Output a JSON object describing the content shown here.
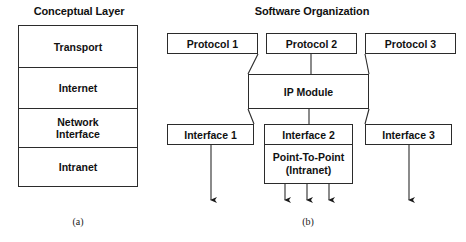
{
  "figure": {
    "panel_a": {
      "title": "Conceptual Layer",
      "caption": "(a)",
      "layers": [
        {
          "label": "Transport"
        },
        {
          "label": "Internet"
        },
        {
          "label_line1": "Network",
          "label_line2": "Interface"
        },
        {
          "label": "Intranet"
        }
      ]
    },
    "panel_b": {
      "title": "Software Organization",
      "caption": "(b)",
      "protocols": [
        {
          "label": "Protocol 1"
        },
        {
          "label": "Protocol 2"
        },
        {
          "label": "Protocol 3"
        }
      ],
      "ip_module": {
        "label": "IP Module"
      },
      "interfaces": [
        {
          "label": "Interface 1"
        },
        {
          "label": "Interface 2",
          "sub_line1": "Point-To-Point",
          "sub_line2": "(Intranet)"
        },
        {
          "label": "Interface 3"
        }
      ]
    },
    "colors": {
      "background": "#ffffff",
      "stroke": "#2b2b2b",
      "text": "#111111"
    }
  }
}
